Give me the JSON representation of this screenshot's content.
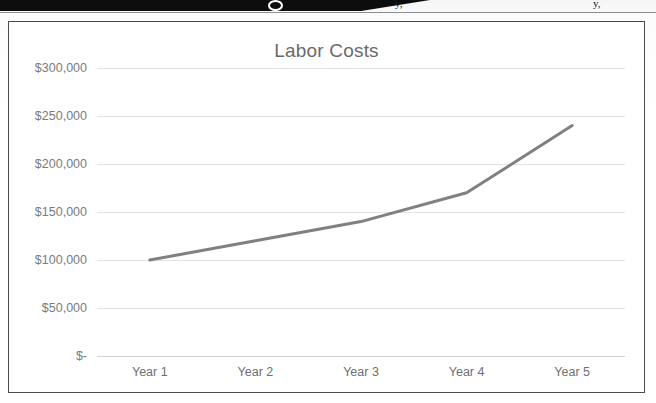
{
  "page": {
    "media": "scanned-document-excerpt",
    "top_banner": {
      "present": true,
      "crop_fragments": [
        "y,",
        "y,"
      ]
    }
  },
  "chart_panel": {
    "border_color": "#4a4a4a",
    "background": "#ffffff"
  },
  "chart_data": {
    "type": "line",
    "title": "Labor Costs",
    "xlabel": "",
    "ylabel": "",
    "categories": [
      "Year 1",
      "Year 2",
      "Year 3",
      "Year 4",
      "Year 5"
    ],
    "values": [
      100000,
      120000,
      140000,
      170000,
      240000
    ],
    "series": [
      {
        "name": "Labor Costs",
        "values": [
          100000,
          120000,
          140000,
          170000,
          240000
        ],
        "color": "#808080",
        "line_width": 3,
        "markers": false
      }
    ],
    "ylim": [
      0,
      300000
    ],
    "ytick_values": [
      0,
      50000,
      100000,
      150000,
      200000,
      250000,
      300000
    ],
    "ytick_labels": [
      "$-",
      "$50,000",
      "$100,000",
      "$150,000",
      "$200,000",
      "$250,000",
      "$300,000"
    ],
    "grid": true,
    "grid_axis": "y",
    "grid_color": "#e3e3e3",
    "legend": false,
    "legend_position": "none",
    "title_color": "#6a6a6a",
    "tick_label_color": "#7b7b7b"
  }
}
